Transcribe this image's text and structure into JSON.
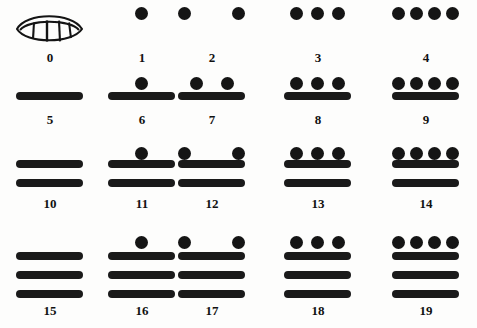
{
  "figure": {
    "colors": {
      "ink": "#1a1a1a",
      "background": "#fdfdfc",
      "label": "#111111"
    },
    "zero_glyph_name": "shell-glyph"
  },
  "chart_data": {
    "type": "table",
    "xlabel": "",
    "ylabel": "",
    "columns": 5,
    "rows": 4,
    "notation": {
      "dot_value": 1,
      "bar_value": 5,
      "zero_symbol": "shell"
    },
    "categories": [
      "0",
      "1",
      "2",
      "3",
      "4",
      "5",
      "6",
      "7",
      "8",
      "9",
      "10",
      "11",
      "12",
      "13",
      "14",
      "15",
      "16",
      "17",
      "18",
      "19"
    ],
    "values": [
      0,
      1,
      2,
      3,
      4,
      5,
      6,
      7,
      8,
      9,
      10,
      11,
      12,
      13,
      14,
      15,
      16,
      17,
      18,
      19
    ],
    "cells": [
      {
        "label": "0",
        "value": 0,
        "dots": 0,
        "bars": 0,
        "shell": true,
        "row": 0,
        "col": 0
      },
      {
        "label": "1",
        "value": 1,
        "dots": 1,
        "bars": 0,
        "shell": false,
        "row": 0,
        "col": 1
      },
      {
        "label": "2",
        "value": 2,
        "dots": 2,
        "bars": 0,
        "shell": false,
        "row": 0,
        "col": 2
      },
      {
        "label": "3",
        "value": 3,
        "dots": 3,
        "bars": 0,
        "shell": false,
        "row": 0,
        "col": 3
      },
      {
        "label": "4",
        "value": 4,
        "dots": 4,
        "bars": 0,
        "shell": false,
        "row": 0,
        "col": 4
      },
      {
        "label": "5",
        "value": 5,
        "dots": 0,
        "bars": 1,
        "shell": false,
        "row": 1,
        "col": 0
      },
      {
        "label": "6",
        "value": 6,
        "dots": 1,
        "bars": 1,
        "shell": false,
        "row": 1,
        "col": 1
      },
      {
        "label": "7",
        "value": 7,
        "dots": 2,
        "bars": 1,
        "shell": false,
        "row": 1,
        "col": 2
      },
      {
        "label": "8",
        "value": 8,
        "dots": 3,
        "bars": 1,
        "shell": false,
        "row": 1,
        "col": 3
      },
      {
        "label": "9",
        "value": 9,
        "dots": 4,
        "bars": 1,
        "shell": false,
        "row": 1,
        "col": 4
      },
      {
        "label": "10",
        "value": 10,
        "dots": 0,
        "bars": 2,
        "shell": false,
        "row": 2,
        "col": 0
      },
      {
        "label": "11",
        "value": 11,
        "dots": 1,
        "bars": 2,
        "shell": false,
        "row": 2,
        "col": 1
      },
      {
        "label": "12",
        "value": 12,
        "dots": 2,
        "bars": 2,
        "shell": false,
        "row": 2,
        "col": 2
      },
      {
        "label": "13",
        "value": 13,
        "dots": 3,
        "bars": 2,
        "shell": false,
        "row": 2,
        "col": 3
      },
      {
        "label": "14",
        "value": 14,
        "dots": 4,
        "bars": 2,
        "shell": false,
        "row": 2,
        "col": 4
      },
      {
        "label": "15",
        "value": 15,
        "dots": 0,
        "bars": 3,
        "shell": false,
        "row": 3,
        "col": 0
      },
      {
        "label": "16",
        "value": 16,
        "dots": 1,
        "bars": 3,
        "shell": false,
        "row": 3,
        "col": 1
      },
      {
        "label": "17",
        "value": 17,
        "dots": 2,
        "bars": 3,
        "shell": false,
        "row": 3,
        "col": 2
      },
      {
        "label": "18",
        "value": 18,
        "dots": 3,
        "bars": 3,
        "shell": false,
        "row": 3,
        "col": 3
      },
      {
        "label": "19",
        "value": 19,
        "dots": 4,
        "bars": 3,
        "shell": false,
        "row": 3,
        "col": 4
      }
    ]
  },
  "layout": {
    "col_x": [
      14,
      106,
      176,
      282,
      390
    ],
    "row_dot_y": [
      5,
      75,
      145,
      234
    ],
    "row_bar_y": [
      0,
      92,
      160,
      252
    ],
    "row_label_y": [
      50,
      112,
      196,
      303
    ],
    "bar_gap": 19,
    "dot_offsets": {
      "1": [
        29
      ],
      "2": [
        14,
        45
      ],
      "3": [
        8,
        29,
        50
      ],
      "4": [
        2,
        20,
        38,
        56
      ]
    },
    "dot_offsets_wide": {
      "2": [
        2,
        56
      ]
    }
  }
}
